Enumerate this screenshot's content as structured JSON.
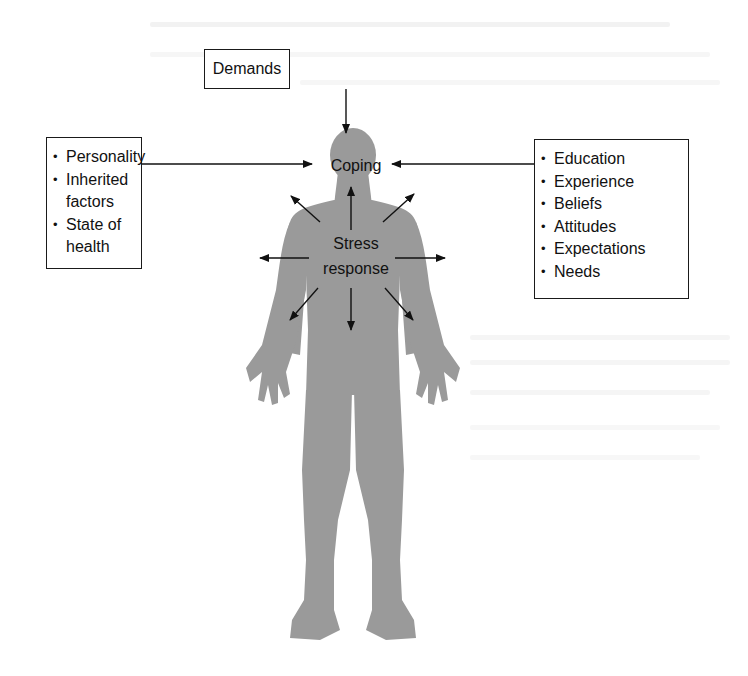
{
  "figure": {
    "demands": {
      "label": "Demands"
    },
    "coping": {
      "label": "Coping"
    },
    "stress_response": {
      "line1": "Stress",
      "line2": "response"
    },
    "left_factors": {
      "items": [
        {
          "label": "Personality"
        },
        {
          "label": "Inherited factors"
        },
        {
          "label": "State of health"
        }
      ]
    },
    "right_factors": {
      "items": [
        {
          "label": "Education"
        },
        {
          "label": "Experience"
        },
        {
          "label": "Beliefs"
        },
        {
          "label": "Attitudes"
        },
        {
          "label": "Expectations"
        },
        {
          "label": "Needs"
        }
      ]
    },
    "colors": {
      "silhouette": "#9a9a9a",
      "ink": "#111111",
      "box_border": "#1a1a1a",
      "background": "#ffffff"
    },
    "arrows": {
      "into_coping": [
        "demands-top",
        "left-factors",
        "right-factors"
      ],
      "from_stress_response": [
        "up",
        "up-left",
        "up-right",
        "left",
        "right",
        "down-left",
        "down",
        "down-right"
      ]
    }
  }
}
